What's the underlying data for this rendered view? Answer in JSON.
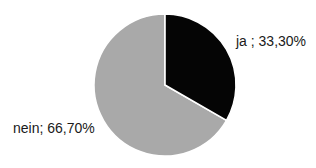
{
  "chart_data": {
    "type": "pie",
    "title": "",
    "subtitle": "",
    "xlabel": "",
    "ylabel": "",
    "grid": false,
    "legend_position": "none",
    "labels_position": "outside",
    "categories": [
      "ja",
      "nein"
    ],
    "values": [
      33.3,
      66.7
    ],
    "value_unit": "%",
    "decimal_separator": ",",
    "start_angle_deg": 0,
    "direction": "clockwise",
    "slices": [
      {
        "name": "ja",
        "value": 33.3,
        "value_text": "33,30%",
        "label_text": "ja ; 33,30%",
        "color": "#050505",
        "start_angle_deg": 0,
        "end_angle_deg": 119.88
      },
      {
        "name": "nein",
        "value": 66.7,
        "value_text": "66,70%",
        "label_text": "nein; 66,70%",
        "color": "#a9a9a9",
        "start_angle_deg": 119.88,
        "end_angle_deg": 360
      }
    ],
    "annotations": [],
    "geometry": {
      "center_x": 165,
      "center_y": 85,
      "radius": 71
    },
    "colors": {
      "background": "#ffffff",
      "slice_ja": "#050505",
      "slice_nein": "#a9a9a9",
      "slice_separator": "#ffffff",
      "label_text": "#1a1a1a"
    }
  }
}
